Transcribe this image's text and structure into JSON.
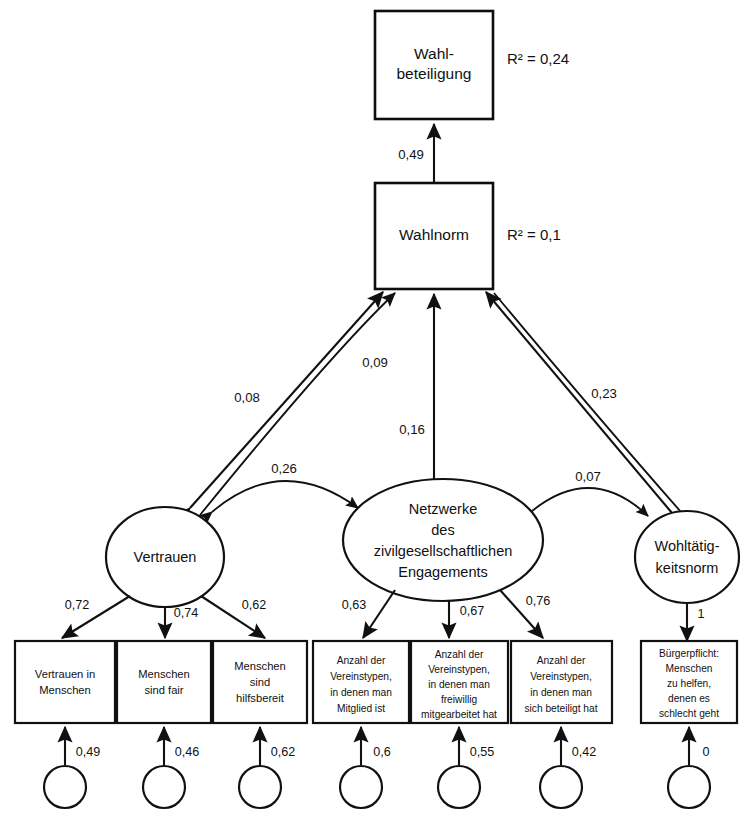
{
  "diagram": {
    "type": "structural-equation-model-path-diagram",
    "language": "de",
    "decimal_separator": ","
  },
  "endogenous_boxes": [
    {
      "id": "wahlbeteiligung",
      "label_line1": "Wahl-",
      "label_line2": "beteiligung",
      "r_squared_label": "R² = 0,24"
    },
    {
      "id": "wahlnorm",
      "label_line1": "Wahlnorm",
      "r_squared_label": "R² = 0,1"
    }
  ],
  "latent_variables": [
    {
      "id": "vertrauen",
      "lines": [
        "Vertrauen"
      ]
    },
    {
      "id": "netzwerke",
      "lines": [
        "Netzwerke",
        "des",
        "zivilgesellschaftlichen",
        "Engagements"
      ]
    },
    {
      "id": "wohltaetigkeitsnorm",
      "lines": [
        "Wohltätig-",
        "keitsnorm"
      ]
    }
  ],
  "indicators": [
    {
      "id": "ind1",
      "lines": [
        "Vertrauen in",
        "Menschen"
      ],
      "loading": "0,72",
      "error": "0,49"
    },
    {
      "id": "ind2",
      "lines": [
        "Menschen",
        "sind fair"
      ],
      "loading": "0,74",
      "error": "0,46"
    },
    {
      "id": "ind3",
      "lines": [
        "Menschen",
        "sind",
        "hilfsbereit"
      ],
      "loading": "0,62",
      "error": "0,62"
    },
    {
      "id": "ind4",
      "lines": [
        "Anzahl der",
        "Vereinstypen,",
        "in denen man",
        "Mitglied ist"
      ],
      "loading": "0,63",
      "error": "0,6"
    },
    {
      "id": "ind5",
      "lines": [
        "Anzahl der",
        "Vereinstypen,",
        "in denen man",
        "freiwillig",
        "mitgearbeitet hat"
      ],
      "loading": "0,67",
      "error": "0,55"
    },
    {
      "id": "ind6",
      "lines": [
        "Anzahl der",
        "Vereinstypen,",
        "in denen man",
        "sich beteiligt hat"
      ],
      "loading": "0,76",
      "error": "0,42"
    },
    {
      "id": "ind7",
      "lines": [
        "Bürgerpflicht:",
        "Menschen",
        "zu helfen,",
        "denen es",
        "schlecht geht"
      ],
      "loading": "1",
      "error": "0"
    }
  ],
  "structural_paths": [
    {
      "id": "wahlnorm-to-wahlbeteiligung",
      "from": "wahlnorm",
      "to": "wahlbeteiligung",
      "coefficient": "0,49"
    },
    {
      "id": "vertrauen-to-wahlnorm",
      "from": "vertrauen",
      "to": "wahlnorm",
      "coefficient": "0,08"
    },
    {
      "id": "vertrauen-curved-to-wahlnorm",
      "from": "vertrauen",
      "to": "wahlnorm",
      "coefficient": "0,09"
    },
    {
      "id": "netzwerke-to-wahlnorm",
      "from": "netzwerke",
      "to": "wahlnorm",
      "coefficient": "0,16"
    },
    {
      "id": "wohltaetigkeitsnorm-to-wahlnorm",
      "from": "wohltaetigkeitsnorm",
      "to": "wahlnorm",
      "coefficient": "0,23"
    }
  ],
  "covariances": [
    {
      "id": "cov-vertrauen-netzwerke",
      "between": [
        "vertrauen",
        "netzwerke"
      ],
      "coefficient": "0,26"
    },
    {
      "id": "cov-netzwerke-wohltaetigkeit",
      "between": [
        "netzwerke",
        "wohltaetigkeitsnorm"
      ],
      "coefficient": "0,07"
    }
  ],
  "colors": {
    "stroke": "#111111",
    "background": "#ffffff",
    "text": "#111111"
  }
}
